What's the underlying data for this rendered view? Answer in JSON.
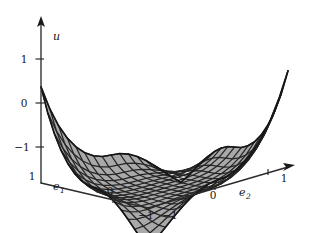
{
  "figure": {
    "type": "surface-plot-3d",
    "background_color": "#ffffff",
    "surface_fill_color": "#a9a9a9",
    "mesh_line_color": "#252525",
    "axis_color": "#2b2b2b"
  },
  "axes": {
    "vertical": {
      "name": "u-axis",
      "label": "u",
      "ticks": [
        {
          "label": "1",
          "value": 1
        },
        {
          "label": "0",
          "value": 0
        },
        {
          "label": "−1",
          "value": -1
        }
      ],
      "has_arrow": true
    },
    "left": {
      "name": "e1-axis",
      "label": "e",
      "subscript": "1",
      "ticks": [
        {
          "label": "1",
          "value": 1
        },
        {
          "label": "0",
          "value": 0
        },
        {
          "label": "−1",
          "value": -1
        }
      ],
      "has_arrow": false
    },
    "right": {
      "name": "e2-axis",
      "label": "e",
      "subscript": "2",
      "ticks": [
        {
          "label": "−1",
          "value": -1
        },
        {
          "label": "0",
          "value": 0
        },
        {
          "label": "1",
          "value": 1
        }
      ],
      "has_arrow": true
    }
  },
  "chart_data": {
    "type": "surface",
    "title": "",
    "xlabel": "e_1",
    "ylabel": "e_2",
    "zlabel": "u",
    "xlim": [
      -1,
      1
    ],
    "ylim": [
      -1,
      1
    ],
    "zlim": [
      -1.6,
      1.6
    ],
    "grid": true,
    "legend": "none",
    "grid_n": 16,
    "surface_formula": "u ~ saddle: u(e1,e2) proportional to e1*e2 shaped, raised at back and dipping at front-left and front-right",
    "x_ticks": [
      -1,
      0,
      1
    ],
    "y_ticks": [
      -1,
      0,
      1
    ],
    "z_ticks": [
      -1,
      0,
      1
    ]
  }
}
